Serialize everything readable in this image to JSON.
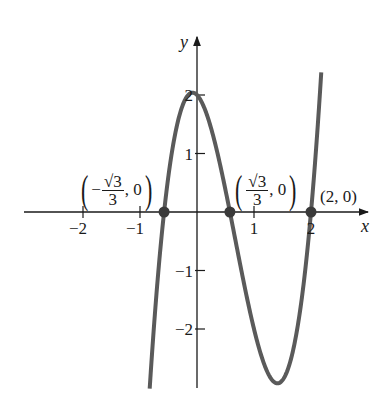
{
  "chart_data": {
    "type": "line",
    "title": "",
    "function": "(x-2)(3x^2-1)",
    "xlabel": "x",
    "ylabel": "y",
    "xlim": [
      -2.8,
      3.0
    ],
    "ylim": [
      -3.0,
      3.0
    ],
    "x_ticks": [
      -2,
      -1,
      1,
      2
    ],
    "x_tick_labels": [
      "−2",
      "−1",
      "1",
      "2"
    ],
    "y_ticks": [
      -2,
      -1,
      1,
      2
    ],
    "y_tick_labels": [
      "−2",
      "−1",
      "1",
      "2"
    ],
    "grid": false,
    "curve_color": "#5a5a5a",
    "series": [
      {
        "name": "f(x)",
        "x_range": [
          -0.83,
          2.18
        ]
      }
    ],
    "points": [
      {
        "x": -0.5774,
        "y": 0,
        "label_sign": "−",
        "label_num": "√3",
        "label_den": "3",
        "label_y": "0"
      },
      {
        "x": 0.5774,
        "y": 0,
        "label_sign": "",
        "label_num": "√3",
        "label_den": "3",
        "label_y": "0"
      },
      {
        "x": 2,
        "y": 0,
        "label": "(2, 0)"
      }
    ]
  }
}
